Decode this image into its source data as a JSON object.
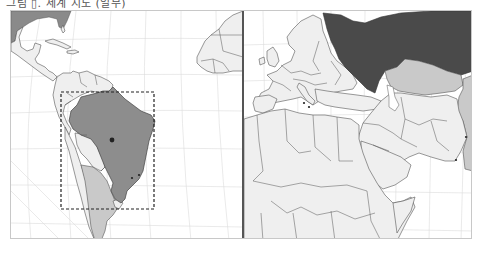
{
  "caption": {
    "text": "그림 ▯. 세계 지도 (일부)"
  },
  "map": {
    "panels": [
      {
        "id": "left",
        "region": "Americas (Caribbean & South America) with West Africa edge",
        "highlighted_country": "Brazil",
        "highlight_fill": "#8d8d8d",
        "secondary_fill": "#c9c9c9",
        "secondary_countries": [
          "Argentina"
        ],
        "focus_box": {
          "style": "dashed",
          "x": 60,
          "y": 91,
          "width": 93,
          "height": 117
        },
        "markers": [
          {
            "name": "capital-marker",
            "x": 111,
            "y": 139,
            "size": "large"
          },
          {
            "name": "city-marker",
            "x": 131,
            "y": 177,
            "size": "small"
          },
          {
            "name": "city-marker",
            "x": 138,
            "y": 174,
            "size": "small"
          }
        ]
      },
      {
        "id": "right",
        "region": "Europe, North Africa, Middle East, Central Asia",
        "highlighted_country": "Russia",
        "highlight_fill": "#4a4a4a",
        "secondary_fill": "#c9c9c9",
        "secondary_countries": [
          "Kazakhstan",
          "China (edge)"
        ],
        "markers": [
          {
            "name": "city-marker",
            "x": 303,
            "y": 102,
            "size": "small"
          },
          {
            "name": "city-marker",
            "x": 308,
            "y": 106,
            "size": "small"
          },
          {
            "name": "city-marker",
            "x": 465,
            "y": 136,
            "size": "small"
          },
          {
            "name": "city-marker",
            "x": 455,
            "y": 159,
            "size": "small"
          }
        ]
      }
    ],
    "colors": {
      "land": "#efefef",
      "border": "#555555",
      "grid": "#dcdcdc",
      "water": "#ffffff",
      "divider": "#555555"
    }
  }
}
